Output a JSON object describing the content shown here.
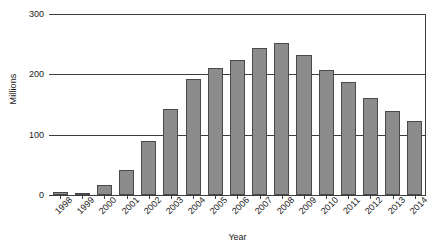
{
  "chart_data": {
    "type": "bar",
    "title": "",
    "xlabel": "Year",
    "ylabel": "Millions",
    "categories": [
      "1998",
      "1999",
      "2000",
      "2001",
      "2002",
      "2003",
      "2004",
      "2005",
      "2006",
      "2007",
      "2008",
      "2009",
      "2010",
      "2011",
      "2012",
      "2013",
      "2014"
    ],
    "values": [
      5,
      4,
      17,
      42,
      90,
      142,
      193,
      210,
      223,
      243,
      252,
      232,
      208,
      188,
      160,
      140,
      122
    ],
    "series": [
      {
        "name": "Millions",
        "values": [
          5,
          4,
          17,
          42,
          90,
          142,
          193,
          210,
          223,
          243,
          252,
          232,
          208,
          188,
          160,
          140,
          122
        ]
      }
    ],
    "ylim": [
      0,
      300
    ],
    "yticks": [
      0,
      100,
      200,
      300
    ],
    "ytick_labels": [
      "0",
      "100",
      "200",
      "300"
    ],
    "grid": true,
    "legend": false,
    "legend_position": "none",
    "bar_color": "#8c8c8c",
    "bar_edge_color": "#4a4a4a",
    "axis_color": "#3d3d3d",
    "background_color": "#ffffff"
  }
}
